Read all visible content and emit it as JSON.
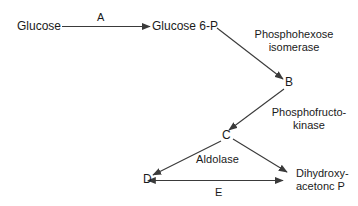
{
  "diagram": {
    "line_color": "#3a3a3a",
    "text_color": "#1a1a1a",
    "background": "#ffffff",
    "metabolites": [
      {
        "id": "glucose",
        "label": "Glucose"
      },
      {
        "id": "glucose6p",
        "label": "Glucose 6-P"
      },
      {
        "id": "b",
        "label": "B"
      },
      {
        "id": "c",
        "label": "C"
      },
      {
        "id": "d",
        "label": "D"
      },
      {
        "id": "dhap",
        "label_line1": "Dihydroxy-",
        "label_line2": "acetonc P"
      }
    ],
    "enzyme_labels": [
      {
        "id": "step-a",
        "label": "A"
      },
      {
        "id": "phosphohexose",
        "line1": "Phosphohexose",
        "line2": "isomerase"
      },
      {
        "id": "phosphofructokinase",
        "line1": "Phosphofructo-",
        "line2": "kinase"
      },
      {
        "id": "aldolase",
        "label": "Aldolase"
      },
      {
        "id": "step-e",
        "label": "E"
      }
    ],
    "arrows": [
      {
        "id": "glucose-to-glucose6p",
        "from": "Glucose",
        "to": "Glucose 6-P",
        "enzyme": "A",
        "style": "horizontal-right"
      },
      {
        "id": "glucose6p-to-b",
        "from": "Glucose 6-P",
        "to": "B",
        "enzyme": "Phosphohexose isomerase",
        "style": "diagonal-down-right"
      },
      {
        "id": "b-to-c",
        "from": "B",
        "to": "C",
        "enzyme": "Phosphofructokinase",
        "style": "diagonal-down-left"
      },
      {
        "id": "c-to-d",
        "from": "C",
        "to": "D",
        "enzyme": "Aldolase",
        "style": "diagonal-down-left"
      },
      {
        "id": "c-to-dhap",
        "from": "C",
        "to": "Dihydroxyacetonc P",
        "enzyme": "Aldolase",
        "style": "diagonal-down-right"
      },
      {
        "id": "d-dhap-reversible",
        "from": "D",
        "to": "Dihydroxyacetonc P",
        "enzyme": "E",
        "style": "horizontal-double-headed"
      }
    ]
  }
}
